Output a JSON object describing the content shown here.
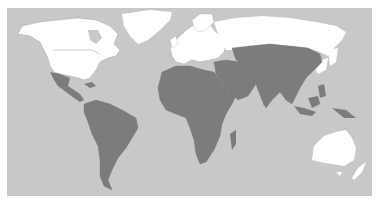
{
  "map": {
    "type": "world-choropleth",
    "colors": {
      "page_background": "#ffffff",
      "ocean": "#c8c8c8",
      "highlighted_land": "#7c7c7c",
      "other_land": "#ffffff",
      "borders": "#9a9a9a"
    },
    "frame": {
      "x": 7,
      "y": 8,
      "width": 365,
      "height": 188
    },
    "regions": {
      "other_land": [
        "North America (USA, Canada)",
        "Greenland",
        "Europe",
        "Russia",
        "Japan",
        "Australia",
        "New Zealand"
      ],
      "highlighted_land": [
        "Mexico & Central America",
        "South America",
        "Africa",
        "Middle East",
        "Central Asia",
        "South Asia",
        "China & East Asia",
        "Southeast Asia",
        "Indonesia & Papua New Guinea",
        "Madagascar"
      ]
    }
  }
}
